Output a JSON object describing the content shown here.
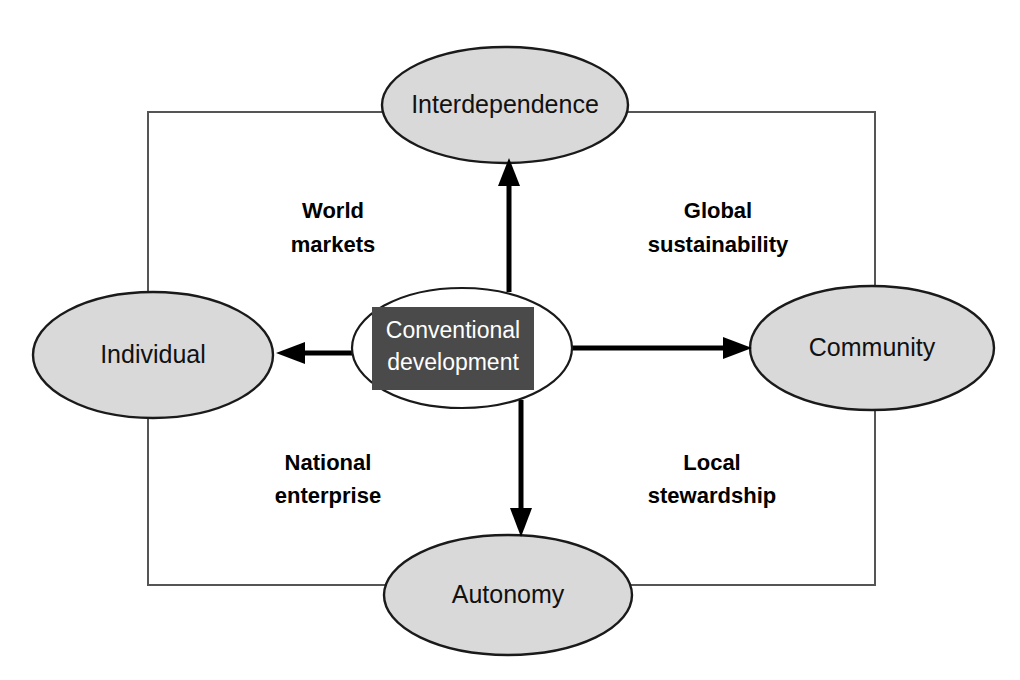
{
  "diagram": {
    "center": {
      "label_line1": "Conventional",
      "label_line2": "development",
      "box_color": "#4a4a4a",
      "text_color": "#ffffff",
      "ellipse_fill": "#ffffff"
    },
    "nodes": [
      {
        "id": "interdependence",
        "label": "Interdependence",
        "position": "top",
        "fill": "#d9d9d9",
        "stroke": "#1a1a1a"
      },
      {
        "id": "individual",
        "label": "Individual",
        "position": "left",
        "fill": "#d9d9d9",
        "stroke": "#1a1a1a"
      },
      {
        "id": "community",
        "label": "Community",
        "position": "right",
        "fill": "#d9d9d9",
        "stroke": "#1a1a1a"
      },
      {
        "id": "autonomy",
        "label": "Autonomy",
        "position": "bottom",
        "fill": "#d9d9d9",
        "stroke": "#1a1a1a"
      }
    ],
    "quadrants": [
      {
        "id": "world-markets",
        "line1": "World",
        "line2": "markets",
        "position": "top-left"
      },
      {
        "id": "global-sustainability",
        "line1": "Global",
        "line2": "sustainability",
        "position": "top-right"
      },
      {
        "id": "national-enterprise",
        "line1": "National",
        "line2": "enterprise",
        "position": "bottom-left"
      },
      {
        "id": "local-stewardship",
        "line1": "Local",
        "line2": "stewardship",
        "position": "bottom-right"
      }
    ],
    "arrows": [
      {
        "id": "arrow-up",
        "from": "conventional-development",
        "to": "interdependence",
        "direction": "up"
      },
      {
        "id": "arrow-left",
        "from": "conventional-development",
        "to": "individual",
        "direction": "left"
      },
      {
        "id": "arrow-right",
        "from": "conventional-development",
        "to": "community",
        "direction": "right"
      },
      {
        "id": "arrow-down",
        "from": "conventional-development",
        "to": "autonomy",
        "direction": "down"
      }
    ],
    "frame": {
      "id": "connector-frame",
      "stroke": "#555555"
    }
  }
}
